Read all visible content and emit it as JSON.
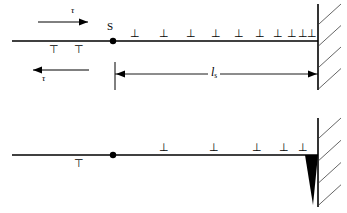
{
  "figure": {
    "type": "technical-line-diagram",
    "colors": {
      "ink": "#000000",
      "background": "#ffffff",
      "wedge": "#000000",
      "hatch": "#555555"
    }
  },
  "panels": [
    {
      "id": "top",
      "name": "pile-up-panel",
      "slip_plane": {
        "name": "slip-plane-line",
        "y": 41,
        "x_start": 12,
        "x_end": 318
      },
      "source": {
        "name": "frank-read-source",
        "label": "S",
        "x": 113,
        "y": 41,
        "label_x": 107,
        "label_y": 21
      },
      "stress_arrow_top": {
        "name": "shear-stress-arrow-right",
        "label": "τ",
        "direction": "right",
        "x_start": 38,
        "x_end": 88,
        "y": 22,
        "label_x": 71,
        "label_y": 6
      },
      "stress_arrow_bottom": {
        "name": "shear-stress-arrow-left",
        "label": "τ",
        "direction": "left",
        "x_start": 89,
        "x_end": 33,
        "y": 70,
        "label_x": 42,
        "label_y": 74
      },
      "dislocations_above": {
        "name": "dislocation-row-above",
        "glyph": "⊥",
        "count": 10,
        "x_positions": [
          134,
          163,
          190,
          215,
          238,
          259,
          277,
          291,
          302,
          311
        ]
      },
      "dislocations_below": {
        "name": "dislocation-row-below",
        "glyph": "⊤",
        "count": 2,
        "x_positions": [
          53,
          78
        ]
      },
      "dimension": {
        "name": "pile-up-length-dimension",
        "label": "l",
        "label_sub": "s",
        "x_start": 115,
        "x_end": 318,
        "y": 74,
        "extension_x": 115,
        "extension_top": 62,
        "extension_bottom": 90,
        "label_x": 208,
        "label_y": 66
      },
      "barrier": {
        "name": "grain-boundary-wall",
        "x": 318,
        "y_top": 4,
        "y_bottom": 90,
        "hatch_count": 4
      }
    },
    {
      "id": "bottom",
      "name": "crack-nucleation-panel",
      "slip_plane": {
        "name": "slip-plane-line",
        "y": 155,
        "x_start": 12,
        "x_end": 318
      },
      "source": {
        "name": "frank-read-source",
        "label": "",
        "x": 113,
        "y": 155
      },
      "dislocations_above": {
        "name": "dislocation-row-above",
        "glyph": "⊥",
        "count": 5,
        "x_positions": [
          163,
          213,
          256,
          283,
          302
        ]
      },
      "dislocations_below": {
        "name": "dislocation-row-below",
        "glyph": "⊤",
        "count": 1,
        "x_positions": [
          78
        ]
      },
      "crack": {
        "name": "crack-wedge",
        "apex_x": 313,
        "apex_y": 205,
        "top_left_x": 305,
        "top_right_x": 318,
        "top_y": 155
      },
      "barrier": {
        "name": "grain-boundary-wall",
        "x": 318,
        "y_top": 118,
        "y_bottom": 207,
        "hatch_count": 4
      }
    }
  ]
}
